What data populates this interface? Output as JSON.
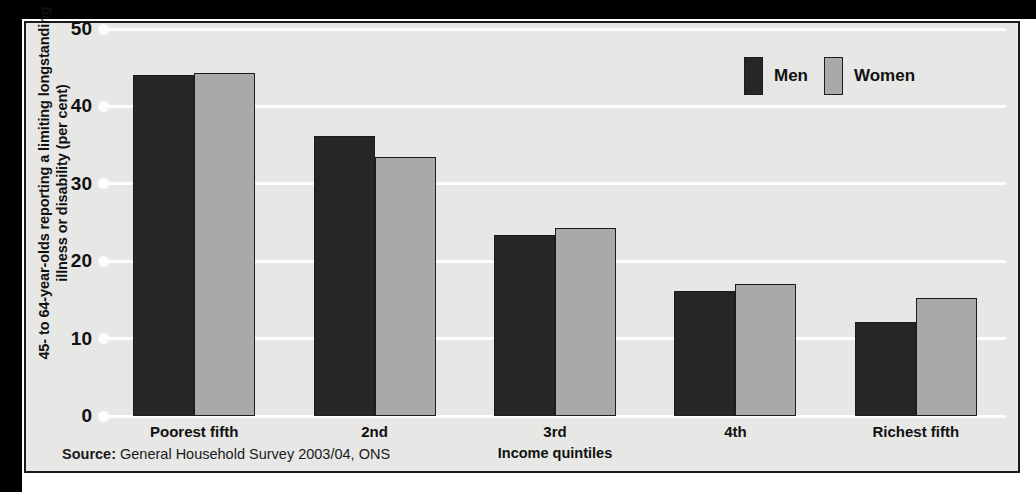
{
  "chart_data": {
    "type": "bar",
    "title": "",
    "xlabel": "Income quintiles",
    "ylabel": "45- to 64-year-olds reporting a limiting longstanding illness or disability (per cent)",
    "categories": [
      "Poorest fifth",
      "2nd",
      "3rd",
      "4th",
      "Richest fifth"
    ],
    "series": [
      {
        "name": "Men",
        "color": "#262626",
        "values": [
          44.0,
          36.2,
          23.4,
          16.2,
          12.2
        ]
      },
      {
        "name": "Women",
        "color": "#a9a9a9",
        "values": [
          44.3,
          33.4,
          24.3,
          17.1,
          15.3
        ]
      }
    ],
    "ylim": [
      0,
      50
    ],
    "yticks": [
      "0",
      "10",
      "20",
      "30",
      "40",
      "50"
    ],
    "ytick_values": [
      0,
      10,
      20,
      30,
      40,
      50
    ],
    "grid": true,
    "legend_position": "top-right"
  },
  "legend": {
    "men_label": "Men",
    "women_label": "Women"
  },
  "axis": {
    "y_title": "45- to 64-year-olds reporting a limiting longstanding illness or disability (per cent)",
    "x_title": "Income quintiles"
  },
  "source": {
    "prefix": "Source:",
    "text": " General Household Survey 2003/04, ONS"
  },
  "colors": {
    "men": "#262626",
    "women": "#a9a9a9",
    "panel_background": "#e7e7e6",
    "gridline": "#fdfdfd",
    "border": "#1a1a1a"
  }
}
